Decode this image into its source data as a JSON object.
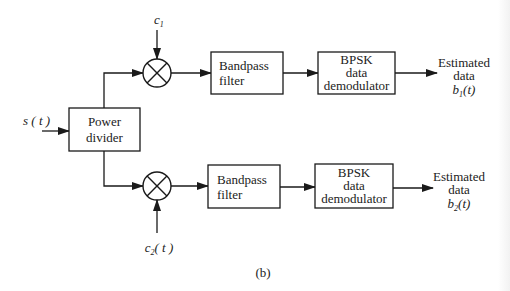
{
  "figure": {
    "caption": "(b)",
    "input": {
      "label": "s ( t )"
    },
    "power_divider": {
      "line1": "Power",
      "line2": "divider"
    },
    "branches": [
      {
        "mixer_input": {
          "symbol": "c",
          "subscript": "1",
          "suffix": ""
        },
        "filter": {
          "line1": "Bandpass",
          "line2": "filter"
        },
        "demodulator": {
          "line1": "BPSK",
          "line2": "data",
          "line3": "demodulator"
        },
        "output": {
          "line1": "Estimated",
          "line2": "data",
          "symbol": "b",
          "subscript": "1",
          "suffix": "(t)"
        }
      },
      {
        "mixer_input": {
          "symbol": "c",
          "subscript": "2",
          "suffix": "( t )"
        },
        "filter": {
          "line1": "Bandpass",
          "line2": "filter"
        },
        "demodulator": {
          "line1": "BPSK",
          "line2": "data",
          "line3": "demodulator"
        },
        "output": {
          "line1": "Estimated",
          "line2": "data",
          "symbol": "b",
          "subscript": "2",
          "suffix": "(t)"
        }
      }
    ],
    "colors": {
      "line": "#1a1a1a",
      "text": "#222222",
      "background": "#ffffff"
    }
  }
}
